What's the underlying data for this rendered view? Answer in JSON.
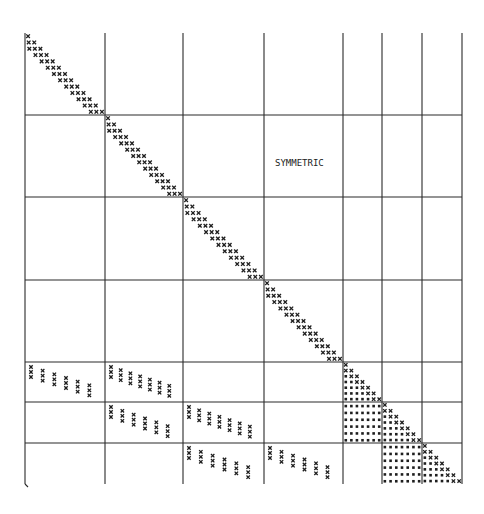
{
  "diagram": {
    "title": "",
    "label": "SYMMETRIC",
    "label_pos": {
      "x": 275,
      "y": 158
    },
    "colors": {
      "line": "#2a2a2a",
      "mark": "#1e1e1e",
      "background": "#ffffff"
    },
    "frame": {
      "left": 25,
      "top": 33,
      "right": 462,
      "bottom": 484
    },
    "grid": {
      "vertical_lines": [
        25,
        105,
        183,
        264,
        343,
        382,
        422,
        462
      ],
      "horizontal_lines": [
        115,
        197,
        280,
        362,
        402,
        443
      ]
    },
    "diagonal_blocks": [
      {
        "x0": 25,
        "y0": 33,
        "x1": 105,
        "y1": 115,
        "band": 3,
        "mark": "x"
      },
      {
        "x0": 105,
        "y0": 115,
        "x1": 183,
        "y1": 197,
        "band": 3,
        "mark": "x"
      },
      {
        "x0": 183,
        "y0": 197,
        "x1": 264,
        "y1": 280,
        "band": 3,
        "mark": "x"
      },
      {
        "x0": 264,
        "y0": 280,
        "x1": 343,
        "y1": 362,
        "band": 3,
        "mark": "x"
      },
      {
        "x0": 343,
        "y0": 362,
        "x1": 382,
        "y1": 402,
        "band": 6,
        "mark": "x-fill"
      },
      {
        "x0": 382,
        "y0": 402,
        "x1": 422,
        "y1": 443,
        "band": 6,
        "mark": "x-fill"
      },
      {
        "x0": 422,
        "y0": 443,
        "x1": 462,
        "y1": 484,
        "band": 6,
        "mark": "x-fill"
      }
    ],
    "coupling_blocks": [
      {
        "x0": 25,
        "y0": 362,
        "x1": 105,
        "y1": 402,
        "cols": 6,
        "mark": "x"
      },
      {
        "x0": 105,
        "y0": 362,
        "x1": 183,
        "y1": 402,
        "cols": 7,
        "mark": "x"
      },
      {
        "x0": 105,
        "y0": 402,
        "x1": 183,
        "y1": 443,
        "cols": 6,
        "mark": "x"
      },
      {
        "x0": 183,
        "y0": 402,
        "x1": 264,
        "y1": 443,
        "cols": 7,
        "mark": "x"
      },
      {
        "x0": 183,
        "y0": 443,
        "x1": 264,
        "y1": 484,
        "cols": 6,
        "mark": "x"
      },
      {
        "x0": 264,
        "y0": 443,
        "x1": 343,
        "y1": 484,
        "cols": 6,
        "mark": "x"
      }
    ],
    "fill_blocks": [
      {
        "x0": 343,
        "y0": 402,
        "x1": 382,
        "y1": 443,
        "rows": 6,
        "cols": 7,
        "mark": "dot"
      },
      {
        "x0": 382,
        "y0": 443,
        "x1": 422,
        "y1": 484,
        "rows": 6,
        "cols": 7,
        "mark": "dot"
      }
    ]
  }
}
